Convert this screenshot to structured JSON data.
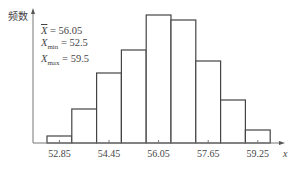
{
  "chart_data": {
    "type": "bar",
    "title": "",
    "xlabel": "x",
    "ylabel": "频数",
    "bin_width": 0.8,
    "categories": [
      "52.85",
      "53.65",
      "54.45",
      "55.25",
      "56.05",
      "56.85",
      "57.65",
      "58.45",
      "59.25"
    ],
    "values": [
      7,
      34,
      70,
      93,
      128,
      123,
      82,
      43,
      13
    ],
    "x_tick_labels": [
      "52.85",
      "54.45",
      "56.05",
      "57.65",
      "59.25"
    ],
    "annotations": [
      "X̄ = 56.05",
      "Xmin = 52.5",
      "Xmax = 59.5"
    ],
    "grid": false,
    "legend": null
  },
  "stats": {
    "mean_symbol": "X",
    "mean_value": "= 56.05",
    "min_symbol": "X",
    "min_sub": "min",
    "min_value": "= 52.5",
    "max_symbol": "X",
    "max_sub": "max",
    "max_value": "= 59.5"
  },
  "axis": {
    "ylabel": "频数",
    "xlabel": "x"
  },
  "colors": {
    "bar_stroke": "#444444",
    "bar_fill": "#ffffff",
    "axis": "#666666",
    "text": "#444444"
  }
}
